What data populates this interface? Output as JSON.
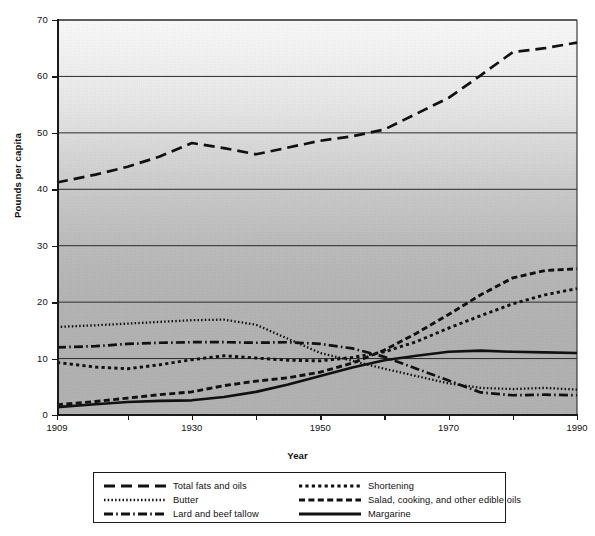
{
  "chart_data": {
    "type": "line",
    "title": "",
    "xlabel": "Year",
    "ylabel": "Pounds per capita",
    "xlim": [
      1909,
      1990
    ],
    "ylim": [
      0,
      70
    ],
    "ytick_values": [
      0,
      10,
      20,
      30,
      40,
      50,
      60,
      70
    ],
    "ytick_labels": [
      "0",
      "10",
      "20",
      "30",
      "40",
      "50",
      "60",
      "70"
    ],
    "xtick_values": [
      1909,
      1930,
      1950,
      1970,
      1990
    ],
    "xtick_labels": [
      "1909",
      "1930",
      "1950",
      "1970",
      "1990"
    ],
    "xminor_ticks": [
      1920,
      1940,
      1960,
      1980
    ],
    "grid": "horizontal",
    "legend_position": "below-plot",
    "background": "gray-gradient-grain",
    "x": [
      1909,
      1915,
      1920,
      1925,
      1930,
      1935,
      1940,
      1945,
      1950,
      1955,
      1960,
      1965,
      1970,
      1975,
      1980,
      1985,
      1990
    ],
    "series": [
      {
        "name": "Total fats and oils",
        "style": "long-dash",
        "color": "#111111",
        "values": [
          41.2,
          42.6,
          44.0,
          45.8,
          48.2,
          47.3,
          46.2,
          47.4,
          48.6,
          49.4,
          50.6,
          53.4,
          56.2,
          60.2,
          64.3,
          65.0,
          66.0
        ]
      },
      {
        "name": "Butter",
        "style": "fine-dot",
        "color": "#111111",
        "values": [
          15.6,
          15.9,
          16.2,
          16.5,
          16.8,
          16.9,
          16.0,
          13.5,
          11.0,
          9.6,
          8.2,
          6.9,
          5.6,
          4.8,
          4.6,
          4.8,
          4.5
        ]
      },
      {
        "name": "Lard and beef tallow",
        "style": "dash-dot",
        "color": "#111111",
        "values": [
          12.0,
          12.2,
          12.6,
          12.8,
          12.9,
          12.9,
          12.8,
          12.9,
          12.6,
          11.8,
          10.3,
          8.2,
          6.1,
          4.0,
          3.5,
          3.6,
          3.5
        ]
      },
      {
        "name": "Shortening",
        "style": "short-dot",
        "color": "#111111",
        "values": [
          9.3,
          8.5,
          8.2,
          8.9,
          9.8,
          10.5,
          10.1,
          9.7,
          9.6,
          10.2,
          11.2,
          13.0,
          15.4,
          17.6,
          19.7,
          21.3,
          22.4
        ]
      },
      {
        "name": "Salad, cooking, and other edible oils",
        "style": "medium-dash",
        "color": "#111111",
        "values": [
          1.8,
          2.4,
          3.0,
          3.6,
          4.1,
          5.2,
          6.0,
          6.6,
          7.6,
          9.2,
          11.5,
          14.5,
          17.8,
          21.3,
          24.3,
          25.6,
          25.9
        ]
      },
      {
        "name": "Margarine",
        "style": "solid",
        "color": "#111111",
        "values": [
          1.4,
          1.9,
          2.3,
          2.5,
          2.6,
          3.2,
          4.1,
          5.4,
          6.9,
          8.4,
          9.7,
          10.5,
          11.2,
          11.4,
          11.2,
          11.1,
          11.0
        ]
      }
    ]
  },
  "axes": {
    "y_title": "Pounds per capita",
    "x_title": "Year"
  },
  "legend": {
    "items": [
      {
        "label": "Total fats and oils",
        "style": "long-dash"
      },
      {
        "label": "Butter",
        "style": "fine-dot"
      },
      {
        "label": "Lard and beef tallow",
        "style": "dash-dot"
      },
      {
        "label": "Shortening",
        "style": "short-dot"
      },
      {
        "label": "Salad, cooking, and other edible oils",
        "style": "medium-dash"
      },
      {
        "label": "Margarine",
        "style": "solid"
      }
    ]
  }
}
